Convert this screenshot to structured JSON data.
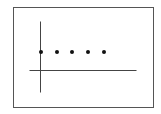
{
  "diagram": {
    "frame": {
      "x": 13,
      "y": 7,
      "width": 140,
      "height": 100,
      "stroke": "#555555"
    },
    "x_axis": {
      "x1": 29,
      "y1": 70,
      "x2": 136,
      "y2": 70,
      "stroke": "#444444"
    },
    "y_axis": {
      "x1": 40,
      "y1": 21,
      "x2": 40,
      "y2": 92,
      "stroke": "#444444"
    },
    "points": [
      {
        "cx": 41,
        "cy": 52
      },
      {
        "cx": 57,
        "cy": 52
      },
      {
        "cx": 72,
        "cy": 52
      },
      {
        "cx": 88,
        "cy": 52
      },
      {
        "cx": 104,
        "cy": 52
      }
    ],
    "point_color": "#111111",
    "point_radius": 2
  }
}
